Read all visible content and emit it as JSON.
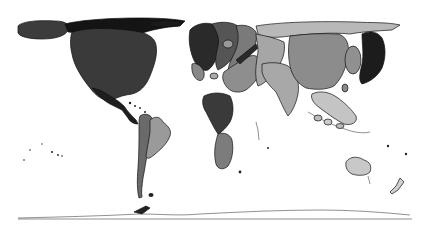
{
  "map": {
    "type": "cartogram",
    "projection": "equirectangular-distorted",
    "background": "#ffffff",
    "regions": [
      {
        "id": "alaska",
        "name": "Alaska",
        "fill": "#3c3c3c"
      },
      {
        "id": "canada-arctic",
        "name": "Canada / Arctic",
        "fill": "#141414"
      },
      {
        "id": "usa",
        "name": "United States",
        "fill": "#3a3a3a"
      },
      {
        "id": "mexico",
        "name": "Mexico / Central America",
        "fill": "#1e1e1e"
      },
      {
        "id": "south-america",
        "name": "South America (west)",
        "fill": "#6a6a6a"
      },
      {
        "id": "brazil",
        "name": "Brazil",
        "fill": "#9a9a9a"
      },
      {
        "id": "greenland",
        "name": "Greenland / Arctic rim",
        "fill": "#1a1a1a"
      },
      {
        "id": "europe-west",
        "name": "Western Europe",
        "fill": "#2a2a2a"
      },
      {
        "id": "europe-central",
        "name": "Central Europe",
        "fill": "#555555"
      },
      {
        "id": "europe-east",
        "name": "Eastern Europe",
        "fill": "#7a7a7a"
      },
      {
        "id": "middle-east",
        "name": "Middle East",
        "fill": "#8e8e8e"
      },
      {
        "id": "russia",
        "name": "Russia",
        "fill": "#b8b8b8"
      },
      {
        "id": "central-asia",
        "name": "Central Asia",
        "fill": "#a6a6a6"
      },
      {
        "id": "south-asia",
        "name": "South Asia / India",
        "fill": "#a8a8a8"
      },
      {
        "id": "china-west",
        "name": "China (west)",
        "fill": "#8c8c8c"
      },
      {
        "id": "china-east",
        "name": "China (east)",
        "fill": "#1c1c1c"
      },
      {
        "id": "korea-japan",
        "name": "Korea / Japan",
        "fill": "#909090"
      },
      {
        "id": "africa-north",
        "name": "North Africa",
        "fill": "#3a3a3a"
      },
      {
        "id": "africa-south",
        "name": "Southern Africa",
        "fill": "#7c7c7c"
      },
      {
        "id": "southeast-asia",
        "name": "Southeast Asia",
        "fill": "#c4c4c4"
      },
      {
        "id": "australia",
        "name": "Australia",
        "fill": "#c8c8c8"
      },
      {
        "id": "new-zealand",
        "name": "New Zealand",
        "fill": "#d0d0d0"
      },
      {
        "id": "antarctica",
        "name": "Antarctica",
        "fill": "#ffffff"
      }
    ],
    "palette": {
      "outline": "#111111",
      "darkest": "#141414",
      "dark": "#3a3a3a",
      "mid": "#8c8c8c",
      "light": "#b8b8b8",
      "lightest": "#d0d0d0"
    }
  }
}
